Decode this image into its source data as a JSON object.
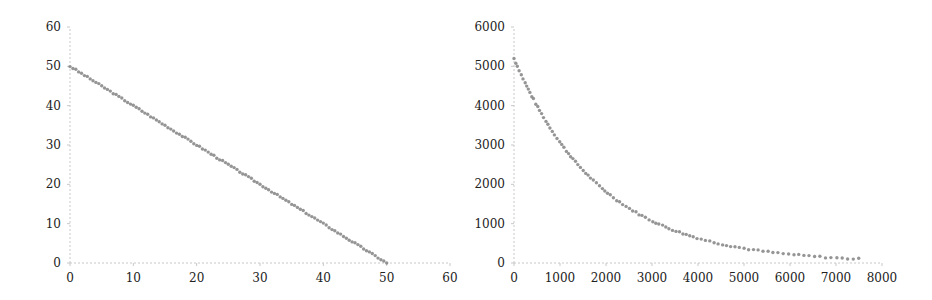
{
  "chart_data": [
    {
      "type": "scatter",
      "title": "",
      "xlabel": "",
      "ylabel": "",
      "xlim": [
        0,
        60
      ],
      "ylim": [
        0,
        60
      ],
      "xticks": [
        0,
        10,
        20,
        30,
        40,
        50,
        60
      ],
      "yticks": [
        0,
        10,
        20,
        30,
        40,
        50,
        60
      ],
      "grid": false,
      "legend": null,
      "marker_color": "#8a8a8a",
      "description": "Linear decreasing scatter: y = 50 - x for x from 0 to 50",
      "series": [
        {
          "name": "",
          "x": [
            0,
            2,
            4,
            6,
            8,
            10,
            12,
            14,
            16,
            18,
            20,
            22,
            24,
            26,
            28,
            30,
            32,
            34,
            36,
            38,
            40,
            42,
            44,
            46,
            48,
            50
          ],
          "y": [
            50,
            48,
            46,
            44,
            42,
            40,
            38,
            36,
            34,
            32,
            30,
            28,
            26,
            24,
            22,
            20,
            18,
            16,
            14,
            12,
            10,
            8,
            6,
            4,
            2,
            0
          ]
        }
      ]
    },
    {
      "type": "scatter",
      "title": "",
      "xlabel": "",
      "ylabel": "",
      "xlim": [
        0,
        8000
      ],
      "ylim": [
        0,
        6000
      ],
      "xticks": [
        0,
        1000,
        2000,
        3000,
        4000,
        5000,
        6000,
        7000,
        8000
      ],
      "yticks": [
        0,
        1000,
        2000,
        3000,
        4000,
        5000,
        6000
      ],
      "grid": false,
      "legend": null,
      "marker_color": "#8a8a8a",
      "description": "Exponential decay scatter from ~5200 at x=0 to ~100 at x=7500",
      "series": [
        {
          "name": "",
          "x": [
            0,
            250,
            500,
            750,
            1000,
            1250,
            1500,
            1750,
            2000,
            2500,
            3000,
            3500,
            4000,
            4500,
            5000,
            5500,
            6000,
            6500,
            7000,
            7500
          ],
          "y": [
            5200,
            4560,
            4000,
            3510,
            3080,
            2700,
            2370,
            2080,
            1820,
            1400,
            1070,
            825,
            635,
            490,
            375,
            290,
            220,
            170,
            130,
            100
          ]
        }
      ]
    }
  ]
}
